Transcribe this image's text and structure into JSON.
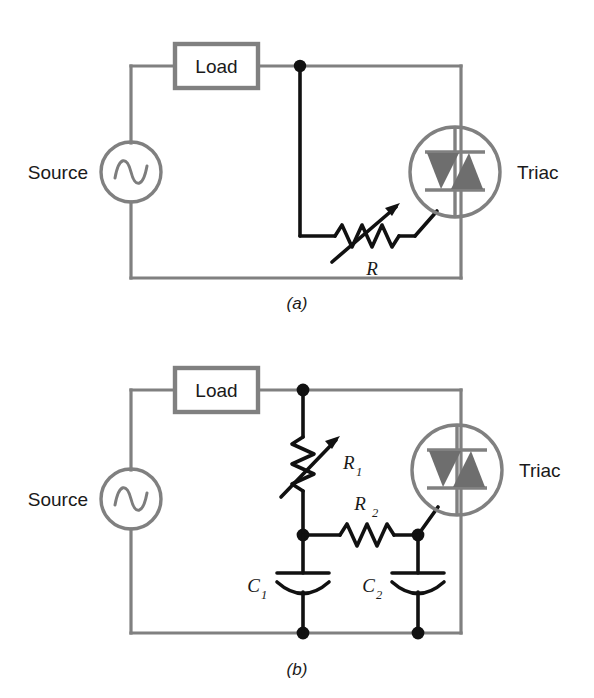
{
  "figure": {
    "background_color": "#ffffff",
    "wire_color": "#808080",
    "signal_color": "#111111",
    "triac_fill_color": "#6e6e6e"
  },
  "circuit_a": {
    "caption": "(a)",
    "source_label": "Source",
    "load_label": "Load",
    "triac_label": "Triac",
    "resistor_label": "R",
    "components": [
      "ac-source",
      "load",
      "variable-resistor-R",
      "triac"
    ]
  },
  "circuit_b": {
    "caption": "(b)",
    "source_label": "Source",
    "load_label": "Load",
    "triac_label": "Triac",
    "resistor1_label": "R",
    "resistor1_sub": "1",
    "resistor2_label": "R",
    "resistor2_sub": "2",
    "capacitor1_label": "C",
    "capacitor1_sub": "1",
    "capacitor2_label": "C",
    "capacitor2_sub": "2",
    "components": [
      "ac-source",
      "load",
      "variable-resistor-R1",
      "resistor-R2",
      "capacitor-C1",
      "capacitor-C2",
      "triac"
    ]
  }
}
